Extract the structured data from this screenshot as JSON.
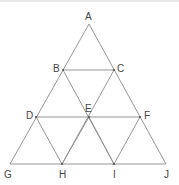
{
  "diagram": {
    "type": "triangular-grid",
    "stroke_color": "#8a8a8a",
    "label_color": "#444444",
    "points": [
      {
        "id": "A",
        "label": "A",
        "x": 89,
        "y": 24,
        "lx": 85,
        "ly": 20
      },
      {
        "id": "B",
        "label": "B",
        "x": 63,
        "y": 70,
        "lx": 53,
        "ly": 72
      },
      {
        "id": "C",
        "label": "C",
        "x": 114,
        "y": 70,
        "lx": 117,
        "ly": 72
      },
      {
        "id": "D",
        "label": "D",
        "x": 36,
        "y": 117,
        "lx": 26,
        "ly": 119
      },
      {
        "id": "E",
        "label": "E",
        "x": 89,
        "y": 117,
        "lx": 85,
        "ly": 112
      },
      {
        "id": "F",
        "label": "F",
        "x": 140,
        "y": 117,
        "lx": 144,
        "ly": 119
      },
      {
        "id": "G",
        "label": "G",
        "x": 10,
        "y": 164,
        "lx": 4,
        "ly": 178
      },
      {
        "id": "H",
        "label": "H",
        "x": 62,
        "y": 164,
        "lx": 59,
        "ly": 178
      },
      {
        "id": "I",
        "label": "I",
        "x": 114,
        "y": 164,
        "lx": 113,
        "ly": 178
      },
      {
        "id": "J",
        "label": "J",
        "x": 166,
        "y": 164,
        "lx": 164,
        "ly": 178
      }
    ],
    "segments": [
      [
        "A",
        "G"
      ],
      [
        "A",
        "J"
      ],
      [
        "G",
        "J"
      ],
      [
        "B",
        "C"
      ],
      [
        "D",
        "F"
      ],
      [
        "B",
        "I"
      ],
      [
        "C",
        "H"
      ],
      [
        "D",
        "H"
      ],
      [
        "F",
        "I"
      ],
      [
        "E",
        "H"
      ],
      [
        "E",
        "I"
      ]
    ]
  }
}
